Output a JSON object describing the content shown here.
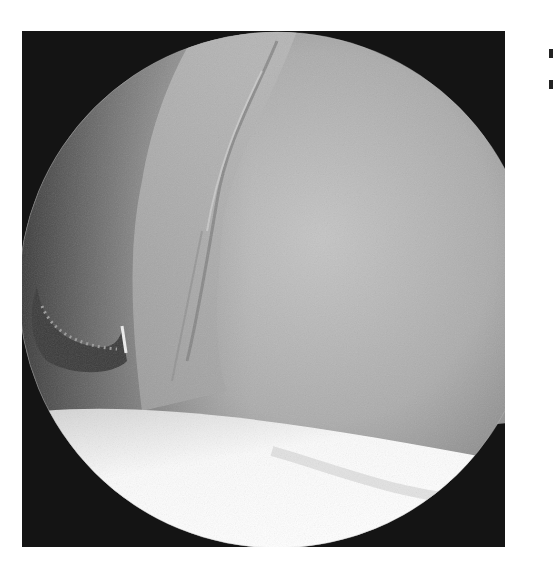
{
  "image": {
    "type": "arthroscopic-view",
    "colors": {
      "background": "#ffffff",
      "frame": "#141414",
      "tissue_mid": "#9a9a9a",
      "tissue_light": "#bdbdbd",
      "cartilage": "#f4f4f4",
      "instrument": "#3a3a3a"
    },
    "regions": [
      {
        "name": "circular-field-of-view",
        "cx": 277,
        "cy": 290,
        "r": 258
      },
      {
        "name": "fibrous-tissue-band",
        "description": "diagonal frayed tissue from top-center to lower-left"
      },
      {
        "name": "articular-surface",
        "description": "smooth grey dome occupying right/center"
      },
      {
        "name": "cartilage-surface",
        "description": "bright white curved surface at bottom"
      },
      {
        "name": "probe-instrument",
        "description": "curved hook at left edge"
      },
      {
        "name": "orientation-notch",
        "description": "triangular marker on right edge"
      }
    ]
  }
}
